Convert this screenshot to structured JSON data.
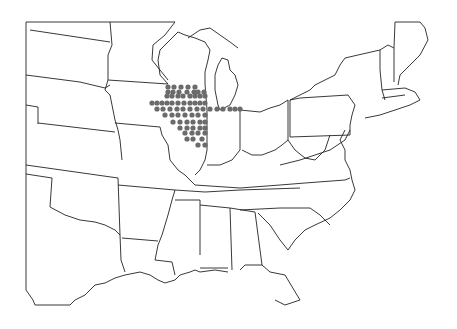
{
  "map": {
    "region": "Eastern United States",
    "dot_color": "#6b6b6b",
    "line_color": "#222222",
    "background": "#ffffff",
    "points": [
      [
        168,
        87
      ],
      [
        174,
        87
      ],
      [
        181,
        87
      ],
      [
        188,
        87
      ],
      [
        195,
        87
      ],
      [
        168,
        92
      ],
      [
        173,
        92
      ],
      [
        179,
        92
      ],
      [
        187,
        92
      ],
      [
        194,
        92
      ],
      [
        198,
        92
      ],
      [
        204,
        92
      ],
      [
        167,
        96
      ],
      [
        172,
        96
      ],
      [
        178,
        96
      ],
      [
        183,
        96
      ],
      [
        190,
        96
      ],
      [
        195,
        96
      ],
      [
        200,
        96
      ],
      [
        205,
        96
      ],
      [
        152,
        103
      ],
      [
        157,
        103
      ],
      [
        162,
        103
      ],
      [
        167,
        103
      ],
      [
        172,
        103
      ],
      [
        178,
        103
      ],
      [
        184,
        103
      ],
      [
        190,
        103
      ],
      [
        195,
        103
      ],
      [
        200,
        103
      ],
      [
        205,
        103
      ],
      [
        157,
        109
      ],
      [
        163,
        109
      ],
      [
        170,
        109
      ],
      [
        177,
        109
      ],
      [
        183,
        109
      ],
      [
        190,
        109
      ],
      [
        197,
        109
      ],
      [
        203,
        109
      ],
      [
        210,
        109
      ],
      [
        217,
        109
      ],
      [
        223,
        109
      ],
      [
        230,
        109
      ],
      [
        235,
        109
      ],
      [
        240,
        109
      ],
      [
        165,
        115
      ],
      [
        172,
        115
      ],
      [
        178,
        115
      ],
      [
        185,
        115
      ],
      [
        192,
        115
      ],
      [
        198,
        115
      ],
      [
        205,
        115
      ],
      [
        173,
        122
      ],
      [
        180,
        122
      ],
      [
        187,
        122
      ],
      [
        193,
        122
      ],
      [
        200,
        122
      ],
      [
        205,
        122
      ],
      [
        180,
        128
      ],
      [
        187,
        128
      ],
      [
        193,
        128
      ],
      [
        200,
        128
      ],
      [
        205,
        128
      ],
      [
        185,
        133
      ],
      [
        192,
        133
      ],
      [
        198,
        133
      ],
      [
        205,
        133
      ],
      [
        187,
        139
      ],
      [
        193,
        139
      ],
      [
        202,
        139
      ],
      [
        198,
        145
      ],
      [
        205,
        145
      ]
    ]
  }
}
